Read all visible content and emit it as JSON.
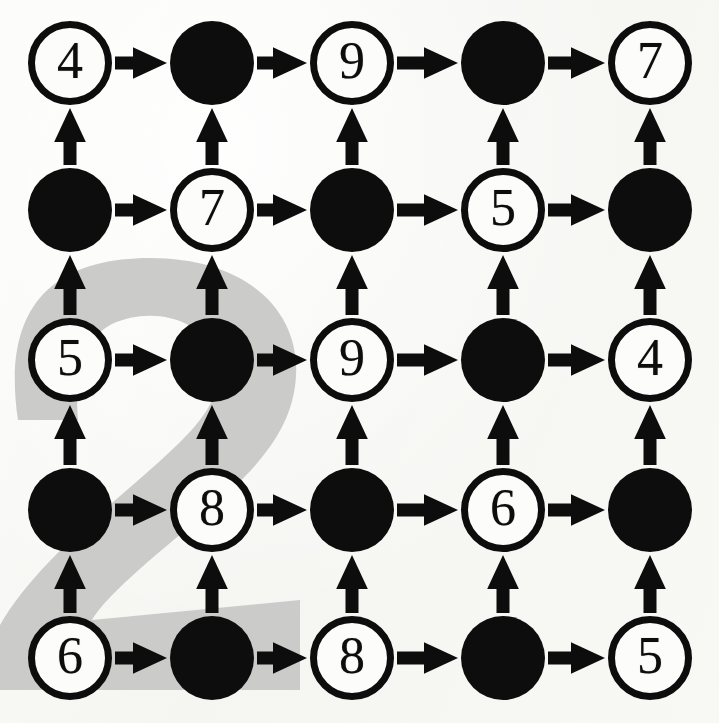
{
  "figure": {
    "type": "directed-grid-graph",
    "caption_digit_watermark": "2",
    "background_color": "#f8f8f6",
    "watermark_color": "#cbcbc9",
    "ink_color": "#0d0d0d",
    "rows": 5,
    "cols": 5,
    "node_radius": 42,
    "col_centers": [
      70,
      212,
      352,
      503,
      650
    ],
    "row_centers": [
      63,
      210,
      360,
      510,
      658
    ]
  },
  "nodes": [
    {
      "id": "r0c0",
      "row": 0,
      "col": 0,
      "state": "open",
      "label": "4"
    },
    {
      "id": "r0c1",
      "row": 0,
      "col": 1,
      "state": "filled",
      "label": ""
    },
    {
      "id": "r0c2",
      "row": 0,
      "col": 2,
      "state": "open",
      "label": "9"
    },
    {
      "id": "r0c3",
      "row": 0,
      "col": 3,
      "state": "filled",
      "label": ""
    },
    {
      "id": "r0c4",
      "row": 0,
      "col": 4,
      "state": "open",
      "label": "7"
    },
    {
      "id": "r1c0",
      "row": 1,
      "col": 0,
      "state": "filled",
      "label": ""
    },
    {
      "id": "r1c1",
      "row": 1,
      "col": 1,
      "state": "open",
      "label": "7"
    },
    {
      "id": "r1c2",
      "row": 1,
      "col": 2,
      "state": "filled",
      "label": ""
    },
    {
      "id": "r1c3",
      "row": 1,
      "col": 3,
      "state": "open",
      "label": "5"
    },
    {
      "id": "r1c4",
      "row": 1,
      "col": 4,
      "state": "filled",
      "label": ""
    },
    {
      "id": "r2c0",
      "row": 2,
      "col": 0,
      "state": "open",
      "label": "5"
    },
    {
      "id": "r2c1",
      "row": 2,
      "col": 1,
      "state": "filled",
      "label": ""
    },
    {
      "id": "r2c2",
      "row": 2,
      "col": 2,
      "state": "open",
      "label": "9"
    },
    {
      "id": "r2c3",
      "row": 2,
      "col": 3,
      "state": "filled",
      "label": ""
    },
    {
      "id": "r2c4",
      "row": 2,
      "col": 4,
      "state": "open",
      "label": "4"
    },
    {
      "id": "r3c0",
      "row": 3,
      "col": 0,
      "state": "filled",
      "label": ""
    },
    {
      "id": "r3c1",
      "row": 3,
      "col": 1,
      "state": "open",
      "label": "8"
    },
    {
      "id": "r3c2",
      "row": 3,
      "col": 2,
      "state": "filled",
      "label": ""
    },
    {
      "id": "r3c3",
      "row": 3,
      "col": 3,
      "state": "open",
      "label": "6"
    },
    {
      "id": "r3c4",
      "row": 3,
      "col": 4,
      "state": "filled",
      "label": ""
    },
    {
      "id": "r4c0",
      "row": 4,
      "col": 0,
      "state": "open",
      "label": "6"
    },
    {
      "id": "r4c1",
      "row": 4,
      "col": 1,
      "state": "filled",
      "label": ""
    },
    {
      "id": "r4c2",
      "row": 4,
      "col": 2,
      "state": "open",
      "label": "8"
    },
    {
      "id": "r4c3",
      "row": 4,
      "col": 3,
      "state": "filled",
      "label": ""
    },
    {
      "id": "r4c4",
      "row": 4,
      "col": 4,
      "state": "open",
      "label": "5"
    }
  ],
  "edges": [
    {
      "from": "r0c0",
      "to": "r0c1",
      "direction": "right"
    },
    {
      "from": "r0c1",
      "to": "r0c2",
      "direction": "right"
    },
    {
      "from": "r0c2",
      "to": "r0c3",
      "direction": "right"
    },
    {
      "from": "r0c3",
      "to": "r0c4",
      "direction": "right"
    },
    {
      "from": "r1c0",
      "to": "r1c1",
      "direction": "right"
    },
    {
      "from": "r1c1",
      "to": "r1c2",
      "direction": "right"
    },
    {
      "from": "r1c2",
      "to": "r1c3",
      "direction": "right"
    },
    {
      "from": "r1c3",
      "to": "r1c4",
      "direction": "right"
    },
    {
      "from": "r2c0",
      "to": "r2c1",
      "direction": "right"
    },
    {
      "from": "r2c1",
      "to": "r2c2",
      "direction": "right"
    },
    {
      "from": "r2c2",
      "to": "r2c3",
      "direction": "right"
    },
    {
      "from": "r2c3",
      "to": "r2c4",
      "direction": "right"
    },
    {
      "from": "r3c0",
      "to": "r3c1",
      "direction": "right"
    },
    {
      "from": "r3c1",
      "to": "r3c2",
      "direction": "right"
    },
    {
      "from": "r3c2",
      "to": "r3c3",
      "direction": "right"
    },
    {
      "from": "r3c3",
      "to": "r3c4",
      "direction": "right"
    },
    {
      "from": "r4c0",
      "to": "r4c1",
      "direction": "right"
    },
    {
      "from": "r4c1",
      "to": "r4c2",
      "direction": "right"
    },
    {
      "from": "r4c2",
      "to": "r4c3",
      "direction": "right"
    },
    {
      "from": "r4c3",
      "to": "r4c4",
      "direction": "right"
    },
    {
      "from": "r1c0",
      "to": "r0c0",
      "direction": "up"
    },
    {
      "from": "r1c1",
      "to": "r0c1",
      "direction": "up"
    },
    {
      "from": "r1c2",
      "to": "r0c2",
      "direction": "up"
    },
    {
      "from": "r1c3",
      "to": "r0c3",
      "direction": "up"
    },
    {
      "from": "r1c4",
      "to": "r0c4",
      "direction": "up"
    },
    {
      "from": "r2c0",
      "to": "r1c0",
      "direction": "up"
    },
    {
      "from": "r2c1",
      "to": "r1c1",
      "direction": "up"
    },
    {
      "from": "r2c2",
      "to": "r1c2",
      "direction": "up"
    },
    {
      "from": "r2c3",
      "to": "r1c3",
      "direction": "up"
    },
    {
      "from": "r2c4",
      "to": "r1c4",
      "direction": "up"
    },
    {
      "from": "r3c0",
      "to": "r2c0",
      "direction": "up"
    },
    {
      "from": "r3c1",
      "to": "r2c1",
      "direction": "up"
    },
    {
      "from": "r3c2",
      "to": "r2c2",
      "direction": "up"
    },
    {
      "from": "r3c3",
      "to": "r2c3",
      "direction": "up"
    },
    {
      "from": "r3c4",
      "to": "r2c4",
      "direction": "up"
    },
    {
      "from": "r4c0",
      "to": "r3c0",
      "direction": "up"
    },
    {
      "from": "r4c1",
      "to": "r3c1",
      "direction": "up"
    },
    {
      "from": "r4c2",
      "to": "r3c2",
      "direction": "up"
    },
    {
      "from": "r4c3",
      "to": "r3c3",
      "direction": "up"
    },
    {
      "from": "r4c4",
      "to": "r3c4",
      "direction": "up"
    }
  ]
}
